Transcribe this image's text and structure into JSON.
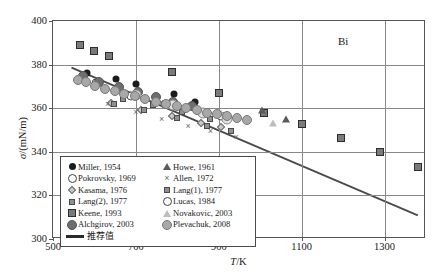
{
  "chart_data": {
    "type": "scatter",
    "title": "",
    "annotation": "Bi",
    "xlabel": "T/K",
    "xlabel_var": "T",
    "xlabel_unit": "/K",
    "ylabel": "σ/(mN/m)",
    "ylabel_var": "σ",
    "ylabel_unit": "/(mN/m)",
    "xlim": [
      500,
      1400
    ],
    "ylim": [
      300,
      400
    ],
    "xticks": [
      500,
      700,
      900,
      1100,
      1300
    ],
    "yticks": [
      300,
      320,
      340,
      360,
      380,
      400
    ],
    "xticklabels": [
      "500",
      "700",
      "900",
      "1100",
      "1300"
    ],
    "yticklabels": [
      "300",
      "320",
      "340",
      "360",
      "380",
      "400"
    ],
    "grid": true,
    "legend_position": "lower-left",
    "series": [
      {
        "name": "Miller, 1954",
        "marker": "filled-circle",
        "points": [
          [
            583,
            376.2
          ],
          [
            652,
            373.4
          ],
          [
            700,
            371.0
          ],
          [
            792,
            366.6
          ],
          [
            843,
            363.0
          ]
        ]
      },
      {
        "name": "Pokrovsky, 1969",
        "marker": "open-circle",
        "points": [
          [
            604,
            371.5
          ],
          [
            688,
            365.8
          ],
          [
            770,
            362.0
          ],
          [
            860,
            358.0
          ],
          [
            905,
            356.2
          ]
        ]
      },
      {
        "name": "Kasama, 1976",
        "marker": "diamond",
        "points": [
          [
            640,
            362.6
          ],
          [
            712,
            359.4
          ],
          [
            788,
            356.2
          ],
          [
            856,
            353.4
          ],
          [
            905,
            351.6
          ]
        ]
      },
      {
        "name": "Lang(2), 1977",
        "marker": "small-square",
        "points": [
          [
            648,
            362.0
          ],
          [
            720,
            359.0
          ],
          [
            800,
            355.4
          ],
          [
            872,
            352.0
          ],
          [
            930,
            349.6
          ]
        ]
      },
      {
        "name": "Keene, 1993",
        "marker": "filled-square",
        "points": [
          [
            566,
            389.0
          ],
          [
            600,
            386.2
          ],
          [
            636,
            384.0
          ],
          [
            788,
            376.6
          ],
          [
            900,
            367.0
          ],
          [
            1010,
            357.8
          ],
          [
            1100,
            352.6
          ],
          [
            1195,
            346.2
          ],
          [
            1290,
            340.0
          ],
          [
            1380,
            333.2
          ]
        ]
      },
      {
        "name": "Alchgirov, 2003",
        "marker": "dark-gray-circle",
        "points": [
          [
            572,
            374.6
          ],
          [
            612,
            372.0
          ],
          [
            660,
            369.6
          ],
          [
            705,
            367.4
          ],
          [
            748,
            365.0
          ],
          [
            790,
            363.0
          ],
          [
            835,
            361.0
          ]
        ]
      },
      {
        "name": "Howe, 1961",
        "marker": "triangle",
        "points": [
          [
            1005,
            359.4
          ],
          [
            1062,
            355.0
          ]
        ]
      },
      {
        "name": "Allen, 1972",
        "marker": "cross",
        "points": [
          [
            632,
            361.8
          ],
          [
            700,
            358.2
          ],
          [
            762,
            355.0
          ],
          [
            826,
            352.0
          ],
          [
            880,
            349.4
          ],
          [
            942,
            346.6
          ]
        ]
      },
      {
        "name": "Lang(1), 1977",
        "marker": "small-square",
        "points": [
          [
            668,
            364.0
          ],
          [
            742,
            361.4
          ],
          [
            812,
            358.2
          ],
          [
            880,
            355.0
          ]
        ]
      },
      {
        "name": "Lucas, 1984",
        "marker": "lt-circle",
        "points": [
          [
            700,
            366.2
          ],
          [
            790,
            361.4
          ],
          [
            862,
            357.6
          ],
          [
            920,
            355.2
          ]
        ]
      },
      {
        "name": "Novakovic, 2003",
        "marker": "open-triangle",
        "points": [
          [
            905,
            358.0
          ],
          [
            1030,
            353.0
          ]
        ]
      },
      {
        "name": "Plevachuk, 2008",
        "marker": "gray-circle",
        "points": [
          [
            560,
            373.0
          ],
          [
            580,
            372.0
          ],
          [
            602,
            370.4
          ],
          [
            625,
            369.0
          ],
          [
            650,
            367.8
          ],
          [
            672,
            366.6
          ],
          [
            698,
            365.4
          ],
          [
            722,
            364.2
          ],
          [
            748,
            363.0
          ],
          [
            772,
            362.0
          ],
          [
            798,
            361.0
          ],
          [
            822,
            360.0
          ],
          [
            848,
            359.0
          ],
          [
            872,
            358.0
          ],
          [
            896,
            357.2
          ],
          [
            920,
            356.4
          ],
          [
            944,
            355.4
          ],
          [
            968,
            354.6
          ]
        ]
      }
    ],
    "trendline": {
      "name": "推荐值",
      "label": "推荐值",
      "start": [
        545,
        378.4
      ],
      "end": [
        1385,
        310.0
      ]
    }
  },
  "legend": {
    "left_column": [
      {
        "label": "Miller, 1954",
        "marker": "filled-circle"
      },
      {
        "label": "Pokrovsky, 1969",
        "marker": "open-circle"
      },
      {
        "label": "Kasama, 1976",
        "marker": "diamond"
      },
      {
        "label": "Lang(2), 1977",
        "marker": "small-square"
      },
      {
        "label": "Keene, 1993",
        "marker": "filled-square"
      },
      {
        "label": "Alchgirov, 2003",
        "marker": "dark-gray-circle"
      }
    ],
    "right_column": [
      {
        "label": "Howe, 1961",
        "marker": "triangle"
      },
      {
        "label": "Allen, 1972",
        "marker": "cross"
      },
      {
        "label": "Lang(1), 1977",
        "marker": "small-square"
      },
      {
        "label": "Lucas, 1984",
        "marker": "open-circle"
      },
      {
        "label": "Novakovic, 2003",
        "marker": "open-triangle"
      },
      {
        "label": "Plevachuk, 2008",
        "marker": "gray-circle"
      }
    ],
    "trend_label": "推荐值"
  },
  "colors": {
    "frame": "#555555",
    "grid": "#888888",
    "trendline": "#4a4a4a",
    "text": "#1a1a1a"
  }
}
